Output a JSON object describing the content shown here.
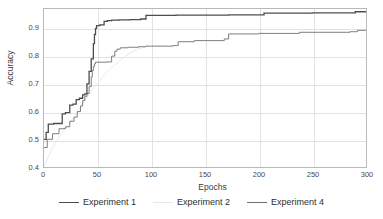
{
  "chart_data": {
    "type": "line",
    "title": "",
    "xlabel": "Epochs",
    "ylabel": "Accuracy",
    "xlim": [
      0,
      300
    ],
    "ylim": [
      0.4,
      0.97
    ],
    "xticks": [
      0,
      50,
      100,
      150,
      200,
      250,
      300
    ],
    "xticklabels": [
      "0",
      "50",
      "100",
      "150",
      "200",
      "250",
      "300"
    ],
    "yticks": [
      0.4,
      0.5,
      0.6,
      0.7,
      0.8,
      0.9
    ],
    "yticklabels": [
      "0.4",
      "0.5",
      "0.6",
      "0.7",
      "0.8",
      "0.9"
    ],
    "grid": true,
    "legend_position": "below-axis",
    "series": [
      {
        "name": "Experiment 1",
        "color": "#4d4d4d",
        "width": 1.3,
        "x": [
          0,
          2,
          2,
          4,
          4,
          9,
          9,
          17,
          17,
          20,
          20,
          24,
          24,
          27,
          27,
          30,
          30,
          33,
          33,
          36,
          36,
          38,
          38,
          40,
          40,
          42,
          42,
          44,
          44,
          46,
          46,
          47,
          47,
          48,
          48,
          49,
          49,
          52,
          52,
          56,
          56,
          59,
          59,
          63,
          63,
          70,
          70,
          80,
          80,
          90,
          90,
          95,
          95,
          123,
          123,
          172,
          172,
          205,
          205,
          250,
          250,
          290,
          290,
          300
        ],
        "y": [
          0.5,
          0.5,
          0.525,
          0.525,
          0.555,
          0.555,
          0.557,
          0.557,
          0.592,
          0.592,
          0.596,
          0.596,
          0.623,
          0.623,
          0.627,
          0.627,
          0.643,
          0.643,
          0.648,
          0.648,
          0.66,
          0.66,
          0.664,
          0.664,
          0.7,
          0.7,
          0.745,
          0.745,
          0.79,
          0.79,
          0.845,
          0.845,
          0.878,
          0.878,
          0.9,
          0.9,
          0.91,
          0.91,
          0.913,
          0.913,
          0.925,
          0.925,
          0.928,
          0.928,
          0.93,
          0.93,
          0.931,
          0.931,
          0.932,
          0.932,
          0.934,
          0.934,
          0.947,
          0.947,
          0.948,
          0.948,
          0.949,
          0.949,
          0.955,
          0.955,
          0.956,
          0.956,
          0.96,
          0.96
        ]
      },
      {
        "name": "Experiment 4",
        "color": "#707070",
        "width": 0.9,
        "x": [
          0,
          3,
          3,
          8,
          8,
          14,
          14,
          20,
          20,
          24,
          24,
          28,
          28,
          31,
          31,
          34,
          34,
          36,
          36,
          38,
          38,
          40,
          40,
          42,
          42,
          44,
          44,
          45,
          45,
          46,
          46,
          47,
          47,
          48,
          48,
          58,
          58,
          63,
          63,
          66,
          66,
          68,
          68,
          71,
          71,
          78,
          78,
          88,
          88,
          95,
          95,
          120,
          120,
          125,
          125,
          140,
          140,
          168,
          168,
          172,
          172,
          200,
          200,
          238,
          238,
          285,
          285,
          292,
          292,
          300
        ],
        "y": [
          0.47,
          0.47,
          0.5,
          0.5,
          0.52,
          0.52,
          0.538,
          0.538,
          0.545,
          0.545,
          0.565,
          0.565,
          0.58,
          0.58,
          0.6,
          0.6,
          0.62,
          0.62,
          0.64,
          0.64,
          0.655,
          0.655,
          0.665,
          0.665,
          0.69,
          0.69,
          0.725,
          0.725,
          0.748,
          0.748,
          0.762,
          0.762,
          0.772,
          0.772,
          0.778,
          0.778,
          0.779,
          0.779,
          0.8,
          0.8,
          0.818,
          0.818,
          0.825,
          0.825,
          0.83,
          0.83,
          0.832,
          0.832,
          0.834,
          0.834,
          0.836,
          0.836,
          0.838,
          0.838,
          0.852,
          0.852,
          0.856,
          0.856,
          0.862,
          0.862,
          0.88,
          0.88,
          0.882,
          0.882,
          0.886,
          0.886,
          0.888,
          0.888,
          0.893,
          0.893
        ]
      },
      {
        "name": "Experiment 2",
        "color": "#e8e8e8",
        "width": 0.9,
        "x": [
          0,
          6,
          12,
          20,
          28,
          34,
          40,
          46,
          52,
          58,
          64,
          70,
          76,
          82,
          88,
          95
        ],
        "y": [
          0.4,
          0.455,
          0.497,
          0.54,
          0.58,
          0.615,
          0.65,
          0.685,
          0.712,
          0.74,
          0.762,
          0.782,
          0.8,
          0.815,
          0.826,
          0.834
        ]
      }
    ]
  },
  "legend": {
    "items": [
      {
        "label": "Experiment 1",
        "color": "#4d4d4d",
        "width": 1.3
      },
      {
        "label": "Experiment 2",
        "color": "#e8e8e8",
        "width": 0.9
      },
      {
        "label": "Experiment 4",
        "color": "#707070",
        "width": 0.9
      }
    ]
  }
}
